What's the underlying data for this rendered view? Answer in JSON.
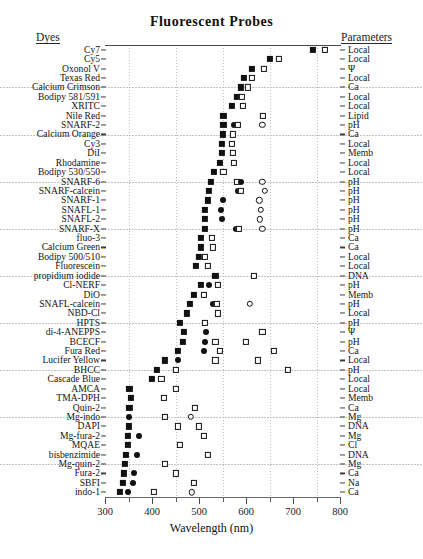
{
  "title": "Fluorescent  Probes",
  "headings": {
    "left": "Dyes",
    "right": "Parameters"
  },
  "chart_data": {
    "type": "scatter",
    "title": "Fluorescent Probes",
    "xlabel": "Wavelength (nm)",
    "ylabel": "Dyes",
    "xlim": [
      300,
      800
    ],
    "xticks": [
      300,
      400,
      500,
      600,
      700,
      800
    ],
    "xticks_minor": [
      350,
      450,
      550,
      650,
      750
    ],
    "grid": "vertical dotted at 350/450/550/650/750 plus faint horizontal rules",
    "legend": "none shown; filled square = excitation max, open square = emission max, filled circle = second excitation, open circle = second emission",
    "marker_types": [
      "filled-square",
      "open-square",
      "filled-circle",
      "open-circle"
    ],
    "categories": [
      "Cy7",
      "Cy5",
      "Oxonol V",
      "Texas Red",
      "Calcium Crimson",
      "Bodipy 581/591",
      "XRITC",
      "Nile Red",
      "SNARF-2",
      "Calcium Orange",
      "Cy3",
      "DiI",
      "Rhodamine",
      "Bodipy 530/550",
      "SNARF-6",
      "SNARF-calcein",
      "SNARF-1",
      "SNAFL-1",
      "SNAFL-2",
      "SNARF-X",
      "fluo-3",
      "Calcium Green",
      "Bodipy 500/510",
      "Fluorescein",
      "propidium iodide",
      "Cl-NERF",
      "DiO",
      "SNAFL-calcein",
      "NBD-Cl",
      "HPTS",
      "di-4-ANEPPS",
      "BCECF",
      "Fura Red",
      "Lucifer Yellow",
      "BHCC",
      "Cascade Blue",
      "AMCA",
      "TMA-DPH",
      "Quin-2",
      "Mg-indo",
      "DAPI",
      "Mg-fura-2",
      "MQAE",
      "bisbenzimide",
      "Mg-quin-2",
      "Fura-2",
      "SBFI",
      "indo-1"
    ],
    "parameters": [
      "Local",
      "Local",
      "Ψ",
      "Local",
      "Ca",
      "Local",
      "Local",
      "Lipid",
      "pH",
      "Ca",
      "Local",
      "Memb",
      "Local",
      "Local",
      "pH",
      "pH",
      "pH",
      "pH",
      "pH",
      "pH",
      "Ca",
      "Ca",
      "Local",
      "Local",
      "DNA",
      "pH",
      "Memb",
      "pH",
      "Local",
      "pH",
      "Ψ",
      "pH",
      "Ca",
      "Local",
      "pH",
      "Local",
      "Local",
      "Memb",
      "Ca",
      "Mg",
      "DNA",
      "Mg",
      "Cl",
      "DNA",
      "Mg",
      "Ca",
      "Na",
      "Ca"
    ],
    "rows": [
      {
        "dye": "Cy7",
        "parameter": "Local",
        "points": [
          {
            "t": "sq-f",
            "nm": 743
          },
          {
            "t": "sq-o",
            "nm": 767
          }
        ]
      },
      {
        "dye": "Cy5",
        "parameter": "Local",
        "points": [
          {
            "t": "sq-f",
            "nm": 650
          },
          {
            "t": "sq-o",
            "nm": 670
          }
        ]
      },
      {
        "dye": "Oxonol V",
        "parameter": "Ψ",
        "points": [
          {
            "t": "sq-f",
            "nm": 612
          },
          {
            "t": "sq-o",
            "nm": 638
          }
        ]
      },
      {
        "dye": "Texas Red",
        "parameter": "Local",
        "points": [
          {
            "t": "sq-f",
            "nm": 595
          },
          {
            "t": "sq-o",
            "nm": 613
          }
        ]
      },
      {
        "dye": "Calcium Crimson",
        "parameter": "Ca",
        "points": [
          {
            "t": "sq-f",
            "nm": 589
          },
          {
            "t": "sq-o",
            "nm": 605
          }
        ]
      },
      {
        "dye": "Bodipy 581/591",
        "parameter": "Local",
        "points": [
          {
            "t": "sq-f",
            "nm": 581
          },
          {
            "t": "sq-o",
            "nm": 591
          }
        ]
      },
      {
        "dye": "XRITC",
        "parameter": "Local",
        "points": [
          {
            "t": "sq-f",
            "nm": 570
          },
          {
            "t": "sq-o",
            "nm": 593
          }
        ]
      },
      {
        "dye": "Nile Red",
        "parameter": "Lipid",
        "points": [
          {
            "t": "sq-f",
            "nm": 552
          },
          {
            "t": "sq-o",
            "nm": 636
          }
        ]
      },
      {
        "dye": "SNARF-2",
        "parameter": "pH",
        "points": [
          {
            "t": "sq-f",
            "nm": 552
          },
          {
            "t": "ci-f",
            "nm": 575
          },
          {
            "t": "sq-o",
            "nm": 582
          },
          {
            "t": "ci-o",
            "nm": 635
          }
        ]
      },
      {
        "dye": "Calcium Orange",
        "parameter": "Ca",
        "points": [
          {
            "t": "sq-f",
            "nm": 550
          },
          {
            "t": "sq-o",
            "nm": 572
          }
        ]
      },
      {
        "dye": "Cy3",
        "parameter": "Local",
        "points": [
          {
            "t": "sq-f",
            "nm": 548
          },
          {
            "t": "sq-o",
            "nm": 570
          }
        ]
      },
      {
        "dye": "DiI",
        "parameter": "Memb",
        "points": [
          {
            "t": "sq-f",
            "nm": 549
          },
          {
            "t": "sq-o",
            "nm": 572
          }
        ]
      },
      {
        "dye": "Rhodamine",
        "parameter": "Local",
        "points": [
          {
            "t": "sq-f",
            "nm": 545
          },
          {
            "t": "sq-o",
            "nm": 575
          }
        ]
      },
      {
        "dye": "Bodipy 530/550",
        "parameter": "Local",
        "points": [
          {
            "t": "sq-f",
            "nm": 532
          },
          {
            "t": "sq-o",
            "nm": 552
          }
        ]
      },
      {
        "dye": "SNARF-6",
        "parameter": "pH",
        "points": [
          {
            "t": "sq-f",
            "nm": 525
          },
          {
            "t": "sq-o",
            "nm": 580
          },
          {
            "t": "ci-f",
            "nm": 590
          },
          {
            "t": "ci-o",
            "nm": 635
          }
        ]
      },
      {
        "dye": "SNARF-calcein",
        "parameter": "pH",
        "points": [
          {
            "t": "sq-f",
            "nm": 522
          },
          {
            "t": "ci-f",
            "nm": 582
          },
          {
            "t": "sq-o",
            "nm": 590
          },
          {
            "t": "ci-o",
            "nm": 640
          }
        ]
      },
      {
        "dye": "SNARF-1",
        "parameter": "pH",
        "points": [
          {
            "t": "sq-f",
            "nm": 518
          },
          {
            "t": "ci-f",
            "nm": 550
          },
          {
            "t": "ci-o",
            "nm": 628
          }
        ]
      },
      {
        "dye": "SNAFL-1",
        "parameter": "pH",
        "points": [
          {
            "t": "sq-f",
            "nm": 512
          },
          {
            "t": "ci-f",
            "nm": 547
          },
          {
            "t": "ci-o",
            "nm": 632
          }
        ]
      },
      {
        "dye": "SNAFL-2",
        "parameter": "pH",
        "points": [
          {
            "t": "sq-f",
            "nm": 512
          },
          {
            "t": "ci-f",
            "nm": 548
          },
          {
            "t": "ci-o",
            "nm": 630
          }
        ]
      },
      {
        "dye": "SNARF-X",
        "parameter": "pH",
        "points": [
          {
            "t": "sq-f",
            "nm": 512
          },
          {
            "t": "ci-f",
            "nm": 578
          },
          {
            "t": "sq-o",
            "nm": 585
          },
          {
            "t": "ci-o",
            "nm": 635
          }
        ]
      },
      {
        "dye": "fluo-3",
        "parameter": "Ca",
        "points": [
          {
            "t": "sq-f",
            "nm": 505
          },
          {
            "t": "sq-o",
            "nm": 528
          }
        ]
      },
      {
        "dye": "Calcium Green",
        "parameter": "Ca",
        "points": [
          {
            "t": "sq-f",
            "nm": 505
          },
          {
            "t": "sq-o",
            "nm": 530
          }
        ]
      },
      {
        "dye": "Bodipy 500/510",
        "parameter": "Local",
        "points": [
          {
            "t": "sq-f",
            "nm": 500
          },
          {
            "t": "sq-o",
            "nm": 512
          }
        ]
      },
      {
        "dye": "Fluorescein",
        "parameter": "Local",
        "points": [
          {
            "t": "sq-f",
            "nm": 494
          },
          {
            "t": "sq-o",
            "nm": 519
          }
        ]
      },
      {
        "dye": "propidium iodide",
        "parameter": "DNA",
        "points": [
          {
            "t": "sq-f",
            "nm": 535
          },
          {
            "t": "sq-o",
            "nm": 617
          }
        ]
      },
      {
        "dye": "Cl-NERF",
        "parameter": "pH",
        "points": [
          {
            "t": "sq-f",
            "nm": 504
          },
          {
            "t": "ci-f",
            "nm": 522
          },
          {
            "t": "sq-o",
            "nm": 540
          }
        ]
      },
      {
        "dye": "DiO",
        "parameter": "Memb",
        "points": [
          {
            "t": "sq-f",
            "nm": 489
          },
          {
            "t": "sq-o",
            "nm": 510
          }
        ]
      },
      {
        "dye": "SNAFL-calcein",
        "parameter": "pH",
        "points": [
          {
            "t": "sq-f",
            "nm": 480
          },
          {
            "t": "ci-f",
            "nm": 530
          },
          {
            "t": "sq-o",
            "nm": 538
          },
          {
            "t": "ci-o",
            "nm": 608
          }
        ]
      },
      {
        "dye": "NBD-Cl",
        "parameter": "Local",
        "points": [
          {
            "t": "sq-f",
            "nm": 475
          },
          {
            "t": "sq-o",
            "nm": 540
          }
        ]
      },
      {
        "dye": "HPTS",
        "parameter": "pH",
        "points": [
          {
            "t": "sq-f",
            "nm": 460
          },
          {
            "t": "sq-o",
            "nm": 512
          }
        ]
      },
      {
        "dye": "di-4-ANEPPS",
        "parameter": "Ψ",
        "points": [
          {
            "t": "sq-f",
            "nm": 468
          },
          {
            "t": "ci-f",
            "nm": 515
          },
          {
            "t": "sq-o",
            "nm": 635
          }
        ]
      },
      {
        "dye": "BCECF",
        "parameter": "pH",
        "points": [
          {
            "t": "sq-f",
            "nm": 465
          },
          {
            "t": "ci-f",
            "nm": 512
          },
          {
            "t": "sq-o",
            "nm": 535
          },
          {
            "t": "sq-o",
            "nm": 600
          }
        ]
      },
      {
        "dye": "Fura Red",
        "parameter": "Ca",
        "points": [
          {
            "t": "sq-f",
            "nm": 455
          },
          {
            "t": "ci-f",
            "nm": 510
          },
          {
            "t": "sq-o",
            "nm": 545
          },
          {
            "t": "sq-o",
            "nm": 660
          }
        ]
      },
      {
        "dye": "Lucifer Yellow",
        "parameter": "Local",
        "points": [
          {
            "t": "sq-f",
            "nm": 428
          },
          {
            "t": "ci-f",
            "nm": 455
          },
          {
            "t": "sq-o",
            "nm": 535
          },
          {
            "t": "sq-o",
            "nm": 625
          }
        ]
      },
      {
        "dye": "BHCC",
        "parameter": "pH",
        "points": [
          {
            "t": "sq-f",
            "nm": 410
          },
          {
            "t": "sq-o",
            "nm": 450
          },
          {
            "t": "sq-o",
            "nm": 690
          }
        ]
      },
      {
        "dye": "Cascade Blue",
        "parameter": "Local",
        "points": [
          {
            "t": "sq-f",
            "nm": 400
          },
          {
            "t": "sq-o",
            "nm": 420
          }
        ]
      },
      {
        "dye": "AMCA",
        "parameter": "Local",
        "points": [
          {
            "t": "sq-f",
            "nm": 352
          },
          {
            "t": "sq-o",
            "nm": 450
          }
        ]
      },
      {
        "dye": "TMA-DPH",
        "parameter": "Memb",
        "points": [
          {
            "t": "sq-f",
            "nm": 355
          },
          {
            "t": "sq-o",
            "nm": 425
          }
        ]
      },
      {
        "dye": "Quin-2",
        "parameter": "Ca",
        "points": [
          {
            "t": "sq-f",
            "nm": 352
          },
          {
            "t": "sq-o",
            "nm": 492
          }
        ]
      },
      {
        "dye": "Mg-indo",
        "parameter": "Mg",
        "points": [
          {
            "t": "ci-f",
            "nm": 350
          },
          {
            "t": "sq-o",
            "nm": 428
          },
          {
            "t": "ci-o",
            "nm": 483
          }
        ]
      },
      {
        "dye": "DAPI",
        "parameter": "DNA",
        "points": [
          {
            "t": "sq-f",
            "nm": 350
          },
          {
            "t": "sq-o",
            "nm": 455
          },
          {
            "t": "sq-o",
            "nm": 500
          }
        ]
      },
      {
        "dye": "Mg-fura-2",
        "parameter": "Mg",
        "points": [
          {
            "t": "sq-f",
            "nm": 348
          },
          {
            "t": "ci-f",
            "nm": 372
          },
          {
            "t": "sq-o",
            "nm": 510
          }
        ]
      },
      {
        "dye": "MQAE",
        "parameter": "Cl",
        "points": [
          {
            "t": "sq-f",
            "nm": 348
          },
          {
            "t": "sq-o",
            "nm": 460
          }
        ]
      },
      {
        "dye": "bisbenzimide",
        "parameter": "DNA",
        "points": [
          {
            "t": "sq-f",
            "nm": 345
          },
          {
            "t": "ci-f",
            "nm": 368
          },
          {
            "t": "sq-o",
            "nm": 518
          }
        ]
      },
      {
        "dye": "Mg-quin-2",
        "parameter": "Mg",
        "points": [
          {
            "t": "sq-f",
            "nm": 342
          },
          {
            "t": "sq-o",
            "nm": 428
          }
        ]
      },
      {
        "dye": "Fura-2",
        "parameter": "Ca",
        "points": [
          {
            "t": "sq-f",
            "nm": 340
          },
          {
            "t": "ci-f",
            "nm": 362
          },
          {
            "t": "sq-o",
            "nm": 450
          }
        ]
      },
      {
        "dye": "SBFI",
        "parameter": "Na",
        "points": [
          {
            "t": "sq-f",
            "nm": 338
          },
          {
            "t": "ci-f",
            "nm": 360
          },
          {
            "t": "sq-o",
            "nm": 490
          }
        ]
      },
      {
        "dye": "indo-1",
        "parameter": "Ca",
        "points": [
          {
            "t": "sq-f",
            "nm": 332
          },
          {
            "t": "ci-f",
            "nm": 348
          },
          {
            "t": "sq-o",
            "nm": 405
          },
          {
            "t": "ci-o",
            "nm": 485
          }
        ]
      }
    ]
  }
}
